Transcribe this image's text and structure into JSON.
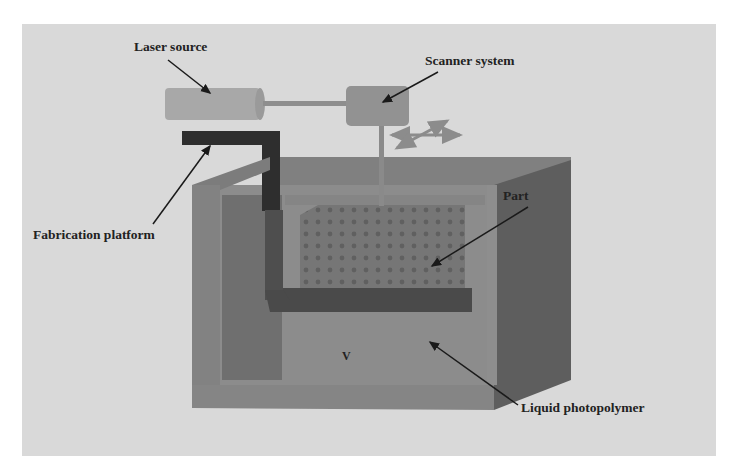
{
  "diagram": {
    "type": "stereolithography-apparatus",
    "labels": {
      "laser_source": "Laser source",
      "scanner_system": "Scanner system",
      "fabrication_platform": "Fabrication platform",
      "part": "Part",
      "liquid_photopolymer": "Liquid photopolymer",
      "vat_mark": "V"
    },
    "colors": {
      "background_panel": "#d9d9d9",
      "laser_body": "#a6a6a6",
      "scanner_body": "#8f8f8f",
      "platform": "#2e2e2e",
      "tank_front": "#7a7a7a",
      "tank_side": "#5c5c5c",
      "liquid": "#8a8a8a",
      "part": "#6e6e6e",
      "arrow": "#1a1a1a"
    }
  }
}
